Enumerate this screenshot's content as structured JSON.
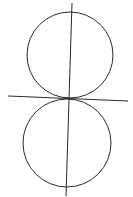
{
  "diagram": {
    "background": "#ffffff",
    "stroke_color": "#2a2a2a",
    "shapes": {
      "top_circle": {
        "cx": 70,
        "cy": 55,
        "r": 43
      },
      "bottom_circle": {
        "cx": 67,
        "cy": 143,
        "r": 44
      },
      "center_line": {
        "x1": 72,
        "y1": 3,
        "x2": 66,
        "y2": 196
      },
      "tangent_line": {
        "x1": 8,
        "y1": 96,
        "x2": 128,
        "y2": 101
      }
    }
  }
}
